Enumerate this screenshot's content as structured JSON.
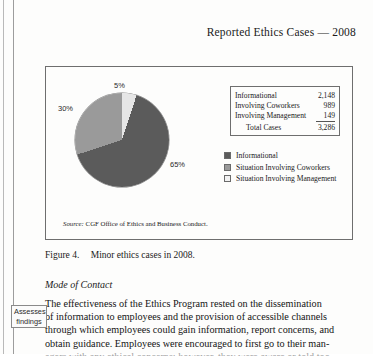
{
  "page": {
    "running_header": "Reported Ethics Cases — 2008"
  },
  "figure": {
    "caption_number": "Figure 4.",
    "caption_text": "Minor ethics cases in 2008.",
    "source_label": "Source:",
    "source_text": "CGF Office of Ethics and Business Conduct."
  },
  "chart_data": {
    "type": "pie",
    "title": "Reported Ethics Cases — 2008",
    "categories": [
      "Informational",
      "Situation Involving Coworkers",
      "Situation Involving Management"
    ],
    "values": [
      65,
      30,
      5
    ],
    "value_labels": [
      "65%",
      "30%",
      "5%"
    ],
    "counts": [
      2148,
      989,
      149
    ],
    "total": 3286,
    "colors": [
      "#5b5b5b",
      "#9a9a9a",
      "#f2f2f2"
    ],
    "legend_position": "right",
    "legend": [
      {
        "label": "Informational",
        "swatch": "dark"
      },
      {
        "label": "Situation Involving Coworkers",
        "swatch": "mid"
      },
      {
        "label": "Situation Involving Management",
        "swatch": "light"
      }
    ],
    "table": {
      "rows": [
        {
          "label": "Informational",
          "value": "2,148"
        },
        {
          "label": "Involving Coworkers",
          "value": "989"
        },
        {
          "label": "Involving Management",
          "value": "149"
        }
      ],
      "total_row": {
        "label": "Total Cases",
        "value": "3,286"
      }
    }
  },
  "section": {
    "heading": "Mode of Contact",
    "paragraph_lines": [
      "The effectiveness of the Ethics Program rested on the dissemination",
      "of information to employees and the provision of accessible channels",
      "through which employees could gain information, report concerns, and",
      "obtain guidance. Employees were encouraged to first go to their man-",
      "agers with any ethical concerns; however, they were aware or told too"
    ]
  },
  "margin_note": {
    "line1": "Assesses",
    "line2": "findings"
  }
}
